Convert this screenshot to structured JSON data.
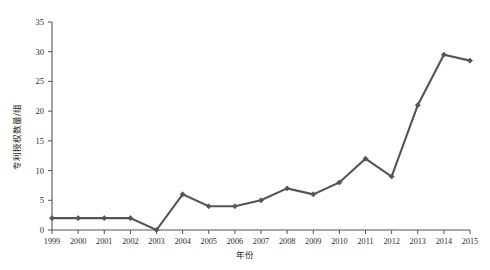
{
  "top_strip": {
    "text": "",
    "note": "faint clipped scan artifact row"
  },
  "chart_data": {
    "type": "line",
    "title": "",
    "xlabel": "年份",
    "ylabel": "专利授权数量/组",
    "categories": [
      "1999",
      "2000",
      "2001",
      "2002",
      "2003",
      "2004",
      "2005",
      "2006",
      "2007",
      "2008",
      "2009",
      "2010",
      "2011",
      "2012",
      "2013",
      "2014",
      "2015"
    ],
    "values": [
      2,
      2,
      2,
      2,
      0,
      6,
      4,
      4,
      5,
      7,
      6,
      8,
      12,
      9,
      21,
      29.5,
      28.5
    ],
    "series": [
      {
        "name": "专利授权数量",
        "values": [
          2,
          2,
          2,
          2,
          0,
          6,
          4,
          4,
          5,
          7,
          6,
          8,
          12,
          9,
          21,
          29.5,
          28.5
        ]
      }
    ],
    "xlim": [
      1999,
      2015
    ],
    "ylim": [
      0,
      35
    ],
    "ytick_labels": [
      "0",
      "5",
      "10",
      "15",
      "20",
      "25",
      "30",
      "35"
    ],
    "ytick_values": [
      0,
      5,
      10,
      15,
      20,
      25,
      30,
      35
    ],
    "xtick_labels": [
      "1999",
      "2000",
      "2001",
      "2002",
      "2003",
      "2004",
      "2005",
      "2006",
      "2007",
      "2008",
      "2009",
      "2010",
      "2011",
      "2012",
      "2013",
      "2014",
      "2015"
    ],
    "grid": false,
    "legend": null,
    "legend_position": "none",
    "marker": "diamond",
    "line_color": "#555555",
    "marker_color": "#555555",
    "background_color": "#ffffff"
  }
}
